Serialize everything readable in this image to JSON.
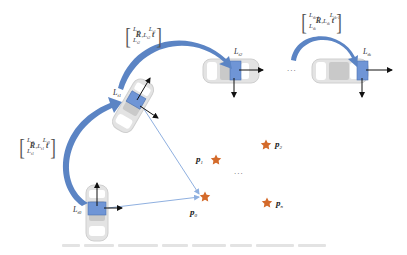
{
  "figure": {
    "type": "diagram",
    "colors": {
      "arc_arrow": "#5b84c4",
      "sensor_box": "#6f95d6",
      "sight_line": "#8fb0e0",
      "star": "#d46a2a",
      "car_body": "#d9d9d9",
      "axis_arrow": "#111111"
    }
  },
  "poses": [
    {
      "id": "t0",
      "frame_label": "L",
      "frame_sub": "t0",
      "orientation": "up"
    },
    {
      "id": "t1",
      "frame_label": "L",
      "frame_sub": "t1",
      "orientation": "tilted"
    },
    {
      "id": "t2",
      "frame_label": "L",
      "frame_sub": "t2",
      "orientation": "right"
    },
    {
      "id": "tk",
      "frame_label": "L",
      "frame_sub": "tk",
      "orientation": "right"
    }
  ],
  "transforms": [
    {
      "from": "t0",
      "to": "t1",
      "top_left": "L",
      "top_left_sub": "t0",
      "top_right": "L",
      "top_right_sub": "t0",
      "bottom_left": "L",
      "bottom_left_sub": "t1",
      "bottom_right": "L",
      "bottom_right_sub": "t1",
      "R": "R",
      "t": "t"
    },
    {
      "from": "t1",
      "to": "t2",
      "top_left": "L",
      "top_left_sub": "t1",
      "top_right": "L",
      "top_right_sub": "t1",
      "bottom_left": "L",
      "bottom_left_sub": "t2",
      "bottom_right": "L",
      "bottom_right_sub": "t2",
      "R": "R",
      "t": "t"
    },
    {
      "from": "tk-1",
      "to": "tk",
      "top_left": "L",
      "top_left_sub": "tk-1",
      "top_right": "L",
      "top_right_sub": "tk-1",
      "bottom_left": "L",
      "bottom_left_sub": "tk",
      "bottom_right": "L",
      "bottom_right_sub": "tk",
      "R": "R",
      "t": "t"
    }
  ],
  "points": [
    {
      "label": "p",
      "sub": "0"
    },
    {
      "label": "p",
      "sub": "1"
    },
    {
      "label": "p",
      "sub": "2"
    },
    {
      "label": "p",
      "sub": "n"
    }
  ],
  "ellipsis": {
    "poses": "...",
    "points": "..."
  }
}
